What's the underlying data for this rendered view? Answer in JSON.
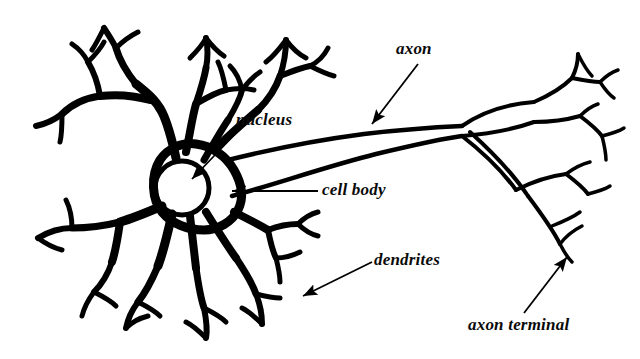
{
  "figure": {
    "style": "black-and-white line drawing",
    "background_color": "#ffffff",
    "ink_color": "#000000"
  },
  "labels": {
    "nucleus": "nucleus",
    "cell_body": "cell body",
    "axon": "axon",
    "dendrites": "dendrites",
    "axon_terminal": "axon terminal"
  },
  "parts": {
    "nucleus": {
      "name": "nucleus",
      "shape": "circle",
      "center_x": 182,
      "center_y": 188,
      "radius": 27
    },
    "cell_body": {
      "name": "cell body",
      "shape": "irregular soma blob"
    },
    "axon": {
      "name": "axon",
      "shape": "long tapering tube"
    },
    "dendrites": {
      "name": "dendrites",
      "shape": "branching tree, forked tips",
      "clusters": [
        "upper-left",
        "lower-left",
        "lower-right-of-soma"
      ]
    },
    "axon_terminal": {
      "name": "axon terminal",
      "shape": "fan of short branches with bulb tips"
    }
  },
  "pointers": [
    {
      "name": "nucleus-arrow",
      "label": "nucleus",
      "from_x": 238,
      "from_y": 131,
      "to_x": 192,
      "to_y": 179
    },
    {
      "name": "cell-body-arrow",
      "label": "cell body",
      "from_x": 318,
      "from_y": 191,
      "to_x": 232,
      "to_y": 191
    },
    {
      "name": "axon-arrow",
      "label": "axon",
      "from_x": 418,
      "from_y": 64,
      "to_x": 372,
      "to_y": 124
    },
    {
      "name": "dendrites-arrow",
      "label": "dendrites",
      "from_x": 372,
      "from_y": 262,
      "to_x": 303,
      "to_y": 296
    },
    {
      "name": "axon-terminal-arrow",
      "label": "axon terminal",
      "from_x": 524,
      "from_y": 313,
      "to_x": 567,
      "to_y": 257
    }
  ],
  "label_positions": {
    "nucleus": {
      "x": 236,
      "y": 111,
      "size": 17
    },
    "cell_body": {
      "x": 322,
      "y": 181,
      "size": 17
    },
    "axon": {
      "x": 396,
      "y": 40,
      "size": 17
    },
    "dendrites": {
      "x": 374,
      "y": 251,
      "size": 17
    },
    "axon_terminal": {
      "x": 468,
      "y": 316,
      "size": 17
    }
  }
}
